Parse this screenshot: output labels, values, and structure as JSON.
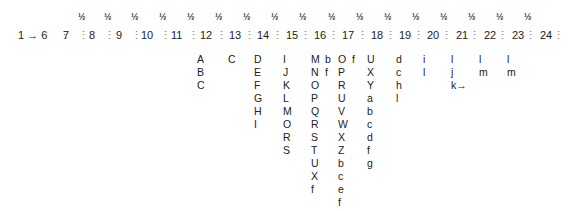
{
  "start_label": "1 → 6",
  "fraction_symbol": "½",
  "numbers": [
    "7",
    "8",
    "9",
    "10",
    "11",
    "12",
    "13",
    "14",
    "15",
    "16",
    "17",
    "18",
    "19",
    "20",
    "21",
    "22",
    "23",
    "24"
  ],
  "fractions_x": [
    78,
    104,
    131,
    159,
    187,
    215,
    243,
    271,
    299,
    328,
    356,
    384,
    412,
    440,
    468,
    496,
    524
  ],
  "numbers_x": [
    63,
    89,
    116,
    141,
    171,
    200,
    229,
    257,
    286,
    314,
    342,
    371,
    399,
    427,
    456,
    484,
    512,
    540
  ],
  "separators_x": [
    59,
    78,
    104,
    131,
    160,
    188,
    216,
    244,
    272,
    300,
    328,
    357,
    385,
    413,
    441,
    469,
    497,
    525,
    553
  ],
  "columns": [
    {
      "x": 197,
      "items": [
        "A",
        "B",
        "C"
      ]
    },
    {
      "x": 228,
      "items": [
        "C"
      ]
    },
    {
      "x": 254,
      "items": [
        "D",
        "E",
        "F",
        "G",
        "H",
        "I"
      ]
    },
    {
      "x": 283,
      "items": [
        "I",
        "J",
        "K",
        "L",
        "M",
        "O",
        "R",
        "S"
      ]
    },
    {
      "x": 311,
      "items": [
        "M",
        "N",
        "O",
        "P",
        "Q",
        "R",
        "S",
        "T",
        "U",
        "X",
        "f"
      ]
    },
    {
      "x": 325,
      "items": [
        "b",
        "f"
      ]
    },
    {
      "x": 338,
      "items": [
        "O",
        "P",
        "R",
        "U",
        "V",
        "W",
        "X",
        "Z",
        "b",
        "c",
        "e",
        "f",
        "g"
      ]
    },
    {
      "x": 352,
      "items": [
        "f"
      ]
    },
    {
      "x": 367,
      "items": [
        "U",
        "X",
        "Y",
        "a",
        "b",
        "c",
        "d",
        "f",
        "g"
      ]
    },
    {
      "x": 396,
      "items": [
        "d",
        "c",
        "h",
        "l"
      ]
    },
    {
      "x": 423,
      "items": [
        "i",
        "l"
      ]
    },
    {
      "x": 451,
      "items": [
        "l",
        "j",
        "k→"
      ]
    },
    {
      "x": 479,
      "items": [
        "l",
        "m"
      ]
    },
    {
      "x": 507,
      "items": [
        "l",
        "m"
      ]
    }
  ]
}
